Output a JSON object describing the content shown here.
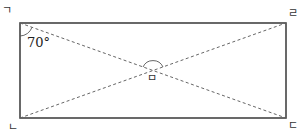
{
  "diagram": {
    "type": "rectangle-with-diagonals",
    "vertices": {
      "top_left": "ㄱ",
      "bottom_left": "ㄴ",
      "bottom_right": "ㄷ",
      "top_right": "ㄹ"
    },
    "intersection_label": "ㅁ",
    "angle_label": "70°",
    "colors": {
      "stroke": "#444444",
      "dashed": "#666666",
      "background": "#ffffff"
    }
  }
}
